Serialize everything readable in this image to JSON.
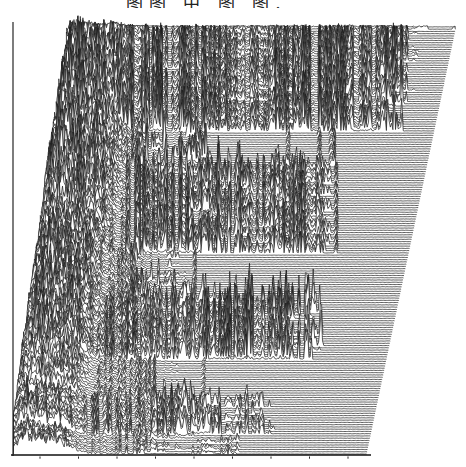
{
  "title": {
    "clipped_text": "图图 中 图 图.",
    "note": "CJK caption cut off at top edge of screenshot; only bottom strokes of glyphs visible"
  },
  "chart_data": {
    "type": "area",
    "subtype": "waterfall-ridgeline",
    "background": "#ffffff",
    "stroke_color": "#1b1b1b",
    "stroke_width": 0.7,
    "seed": 20240518,
    "n_traces": 190,
    "top_baseline_y": 27,
    "trace_spacing": 2.26,
    "sample_step": 1.3,
    "right_end_top_x": 456,
    "right_edge_shift_per_trace": 0.473,
    "peak_cap_margin": 26,
    "mountain": {
      "foot_base": 68,
      "foot_ref_y": 50,
      "foot_slope": 0.146,
      "foot_min": 13.5,
      "center_offset": 14,
      "sigma1": 11,
      "hump2_offset": 30,
      "sigma2": 14,
      "hump2_scale": 0.75,
      "amp_min": 48,
      "amp_var": 50,
      "extent": 70
    },
    "axes": {
      "left": {
        "x": 13,
        "y_top": 22,
        "y_bottom": 456
      },
      "bottom": {
        "y": 455,
        "x_left": 11,
        "x_right": 371
      },
      "ticks": {
        "y": 456.5,
        "start_x": 40,
        "step": 38.5,
        "count": 9,
        "len": 2.2
      }
    },
    "bands": [
      {
        "name": "A-heavy-top",
        "from": 0,
        "to": 46,
        "mode": "active",
        "amp": 62,
        "mid_start": 105,
        "inner_amp": 30,
        "m_scale": 1.0,
        "ae_from_right": [
          25,
          45
        ],
        "post_len": 30,
        "sparse_amp": 12
      },
      {
        "name": "gap-1",
        "from": 47,
        "to": 61,
        "mode": "sparse",
        "amp": 16,
        "mid_start": 135,
        "inner_amp": 14,
        "m_scale": 0.95,
        "ae": 205,
        "ae_var": 10,
        "sparse_to": 345,
        "sparse_amp": 13
      },
      {
        "name": "B-heavy-mid",
        "from": 62,
        "to": 100,
        "mode": "active",
        "amp": 58,
        "mid_start": 135,
        "inner_amp": 18,
        "m_scale": 0.95,
        "ae": 322,
        "ae_var": 16,
        "post_len": 30,
        "sparse_amp": 12
      },
      {
        "name": "gap-2",
        "from": 101,
        "to": 120,
        "mode": "sparse",
        "amp": 12,
        "mid_start": 130,
        "inner_amp": 11,
        "m_scale": 0.9,
        "ae": 180,
        "ae_var": 10,
        "sparse_to": 240,
        "sparse_amp": 9
      },
      {
        "name": "C-heavy-lower",
        "from": 121,
        "to": 147,
        "mode": "active",
        "amp": 44,
        "mid_start": 130,
        "inner_amp": 16,
        "m_scale": 0.9,
        "ae": 305,
        "ae_var": 20,
        "post_len": 25,
        "sparse_amp": 10
      },
      {
        "name": "gap-3",
        "from": 148,
        "to": 164,
        "mode": "sparse",
        "amp": 9,
        "mid_start": 150,
        "inner_amp": 9,
        "m_scale": 0.8,
        "ae": 175,
        "ae_var": 8,
        "sparse_to": 230,
        "sparse_amp": 7
      },
      {
        "name": "D-small-bottom",
        "from": 165,
        "to": 180,
        "mode": "active",
        "amp": 30,
        "mid_start": 150,
        "inner_amp": 12,
        "m_scale": 0.6,
        "ae": 262,
        "ae_var": 14,
        "post_len": 38,
        "sparse_amp": 8
      },
      {
        "name": "E-quiet-bottom",
        "from": 181,
        "to": 189,
        "mode": "active",
        "amp": 11,
        "mid_start": 120,
        "inner_amp": 6,
        "m_scale": 0.35,
        "ae": 232,
        "ae_var": 10,
        "post_len": 18,
        "sparse_amp": 5
      }
    ]
  }
}
